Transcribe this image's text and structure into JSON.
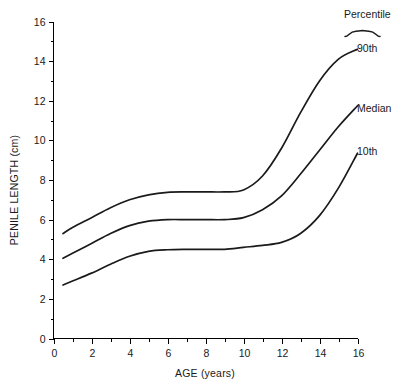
{
  "chart_data": {
    "type": "line",
    "title": "",
    "xlabel": "AGE (years)",
    "ylabel": "PENILE LENGTH (cm)",
    "xlim": [
      0,
      16
    ],
    "ylim": [
      0,
      16
    ],
    "xticks": [
      0,
      2,
      4,
      6,
      8,
      10,
      12,
      14,
      16
    ],
    "xtick_labels": [
      "0",
      "2",
      "4",
      "6",
      "8",
      "10",
      "12",
      "14",
      "16"
    ],
    "xticks_minor": [
      1,
      3,
      5,
      7,
      9,
      11,
      13,
      15
    ],
    "yticks": [
      0,
      2,
      4,
      6,
      8,
      10,
      12,
      14,
      16
    ],
    "ytick_labels": [
      "0",
      "2",
      "4",
      "6",
      "8",
      "10",
      "12",
      "14",
      "16"
    ],
    "yticks_minor": [
      1,
      3,
      5,
      7,
      9,
      11,
      13,
      15
    ],
    "grid": false,
    "legend_position": "right-inline",
    "legend_title": "Percentile",
    "x": [
      0.5,
      1,
      2,
      3,
      4,
      5,
      6,
      7,
      8,
      9,
      10,
      11,
      12,
      13,
      14,
      15,
      16
    ],
    "series": [
      {
        "name": "90th",
        "label": "90th",
        "values": [
          5.3,
          5.6,
          6.1,
          6.6,
          7.0,
          7.25,
          7.38,
          7.4,
          7.4,
          7.4,
          7.5,
          8.2,
          9.6,
          11.4,
          13.0,
          14.1,
          14.6
        ]
      },
      {
        "name": "Median",
        "label": "Median",
        "values": [
          4.05,
          4.3,
          4.8,
          5.3,
          5.7,
          5.92,
          6.0,
          6.0,
          6.0,
          6.0,
          6.1,
          6.5,
          7.2,
          8.3,
          9.5,
          10.7,
          11.75
        ]
      },
      {
        "name": "10th",
        "label": "10th",
        "values": [
          2.7,
          2.9,
          3.3,
          3.75,
          4.15,
          4.4,
          4.48,
          4.5,
          4.5,
          4.5,
          4.6,
          4.7,
          4.85,
          5.3,
          6.2,
          7.6,
          9.35
        ]
      }
    ]
  },
  "axes": {
    "x_title": "AGE (years)",
    "y_title": "PENILE LENGTH (cm)"
  },
  "legend": {
    "title": "Percentile",
    "entries": [
      {
        "label": "90th"
      },
      {
        "label": "Median"
      },
      {
        "label": "10th"
      }
    ]
  },
  "ticks": {
    "x": [
      "0",
      "2",
      "4",
      "6",
      "8",
      "10",
      "12",
      "14",
      "16"
    ],
    "y": [
      "0",
      "2",
      "4",
      "6",
      "8",
      "10",
      "12",
      "14",
      "16"
    ]
  },
  "colors": {
    "line": "#1a1a1a",
    "axis": "#000000",
    "background": "#ffffff"
  }
}
